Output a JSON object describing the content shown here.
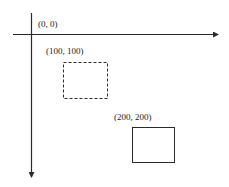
{
  "diagram": {
    "title": "",
    "axes": {
      "x_axis": {
        "direction": "right",
        "arrow": true
      },
      "y_axis": {
        "direction": "down",
        "arrow": true
      }
    },
    "labels": {
      "origin": "(0, 0)",
      "box1": "(100, 100)",
      "box2": "(200, 200)"
    },
    "boxes": [
      {
        "name": "box-at-100-100",
        "style": "dashed",
        "label": "(100, 100)"
      },
      {
        "name": "box-at-200-200",
        "style": "solid",
        "label": "(200, 200)"
      }
    ],
    "colors": {
      "stroke": "#2a2a2a",
      "background": "#ffffff"
    }
  }
}
